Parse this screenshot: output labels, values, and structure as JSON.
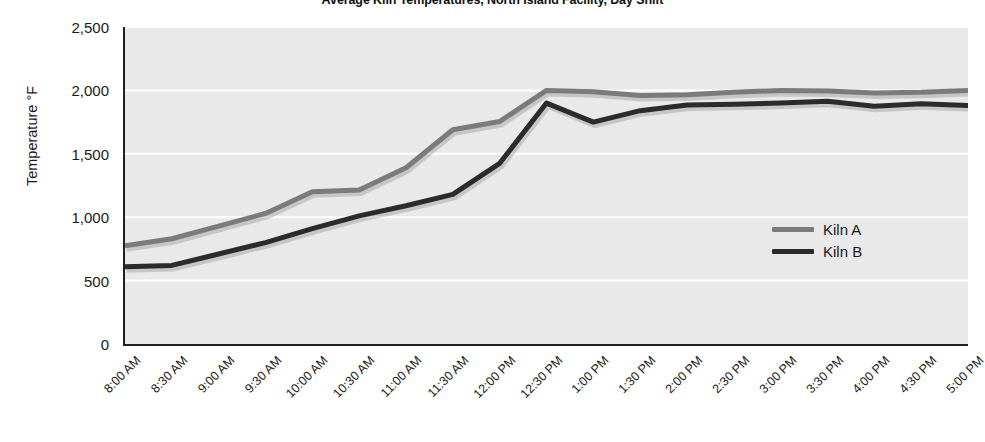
{
  "chart_data": {
    "type": "line",
    "title": "Average Kiln Temperatures, North Island Facility, Day Shift",
    "xlabel": "",
    "ylabel": "Temperature  °F",
    "ylim": [
      0,
      2500
    ],
    "ytick_step": 500,
    "ytick_labels": [
      "2,500",
      "2,000",
      "1,500",
      "1,000",
      "500",
      "0"
    ],
    "ytick_values": [
      2500,
      2000,
      1500,
      1000,
      500,
      0
    ],
    "grid": "horizontal",
    "grid_color": "#ffffff",
    "plot_background": "#e9e9e9",
    "legend_position": "inside-right",
    "categories": [
      "8:00 AM",
      "8:30 AM",
      "9:00 AM",
      "9:30 AM",
      "10:00 AM",
      "10:30 AM",
      "11:00 AM",
      "11:30 AM",
      "12:00 PM",
      "12:30 PM",
      "1:00 PM",
      "1:30 PM",
      "2:00 PM",
      "2:30 PM",
      "3:00 PM",
      "3:30 PM",
      "4:00 PM",
      "4:30 PM",
      "5:00 PM"
    ],
    "series": [
      {
        "name": "Kiln A",
        "color": "#7b7b7b",
        "values": [
          775,
          830,
          930,
          1030,
          1200,
          1215,
          1390,
          1690,
          1755,
          2000,
          1990,
          1960,
          1965,
          1985,
          2000,
          1995,
          1980,
          1985,
          2000
        ]
      },
      {
        "name": "Kiln B",
        "color": "#2b2b2b",
        "values": [
          610,
          620,
          710,
          800,
          910,
          1010,
          1090,
          1180,
          1425,
          1900,
          1750,
          1840,
          1885,
          1890,
          1900,
          1915,
          1875,
          1895,
          1880
        ]
      }
    ]
  },
  "legend": {
    "items": [
      {
        "label": "Kiln A",
        "color": "#7b7b7b"
      },
      {
        "label": "Kiln B",
        "color": "#2b2b2b"
      }
    ]
  }
}
